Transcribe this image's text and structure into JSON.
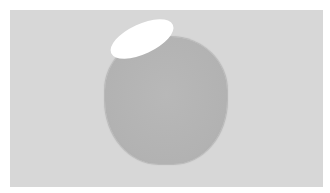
{
  "scene": {
    "description": "Gray rounded blob on light gray background with a white elliptical highlight at its top-left",
    "background_color": "#ffffff",
    "panel_color": "#d7d7d7",
    "blob_color": "#b3b3b3",
    "highlight_color": "#ffffff"
  }
}
